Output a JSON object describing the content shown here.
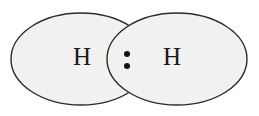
{
  "diagram": {
    "type": "lewis-overlap-venn",
    "background_color": "#ffffff",
    "lobe_fill_color": "#f1f1ef",
    "lobe_stroke_color": "#2b2b2b",
    "lobe_stroke_width": 1.4,
    "dot_color": "#111111",
    "label_color": "#1a1a1a",
    "atoms": [
      {
        "id": "left-atom",
        "label": "H",
        "cx": 81,
        "cy": 59,
        "rx": 70,
        "ry": 46,
        "label_x": 82,
        "label_y": 59
      },
      {
        "id": "right-atom",
        "label": "H",
        "cx": 177,
        "cy": 59,
        "rx": 70,
        "ry": 46,
        "label_x": 172,
        "label_y": 59
      }
    ],
    "shared_pair": {
      "name": "shared electron pair",
      "cx": 127,
      "dot_radius": 3,
      "dots": [
        {
          "cx": 127,
          "cy": 54
        },
        {
          "cx": 127,
          "cy": 66
        }
      ]
    },
    "intersections": [
      {
        "x": 127,
        "y": 26
      },
      {
        "x": 127,
        "y": 92
      }
    ]
  }
}
